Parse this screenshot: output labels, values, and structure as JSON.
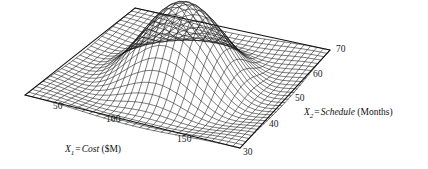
{
  "figure": {
    "background_color": "#ffffff",
    "mesh_color": "#111111",
    "text_color": "#1a1a1a"
  },
  "axes": {
    "x1": {
      "symbol": "X",
      "subscript": "1",
      "equals": "=",
      "variable": "Cost",
      "units": "($M)",
      "full_label": "X1 = Cost ($M)",
      "ticks": [
        "50",
        "100",
        "150"
      ]
    },
    "x2": {
      "symbol": "X",
      "subscript": "2",
      "equals": "=",
      "variable": "Schedule",
      "units": "(Months)",
      "full_label": "X2 = Schedule (Months)",
      "ticks": [
        "30",
        "40",
        "50",
        "60",
        "70"
      ]
    }
  },
  "chart_data": {
    "type": "surface",
    "title": "",
    "subtitle": "",
    "xlabel": "X1 = Cost ($M)",
    "ylabel": "X2 = Schedule (Months)",
    "zlabel": "",
    "projection": "3d-wireframe-mesh",
    "grid": true,
    "legend": null,
    "x": {
      "name": "Cost",
      "units": "$M",
      "tick_values": [
        50,
        100,
        150
      ],
      "range": [
        25,
        175
      ]
    },
    "y": {
      "name": "Schedule",
      "units": "Months",
      "tick_values": [
        30,
        40,
        50,
        60,
        70
      ],
      "range": [
        25,
        75
      ]
    },
    "z": {
      "name": "Probability density",
      "units": "",
      "tick_values": [],
      "range": [
        0,
        1
      ]
    },
    "surface": {
      "description": "Bivariate gaussian-like joint probability density surface with a single central peak",
      "form": "bivariate_normal",
      "mean_x": 100,
      "mean_y": 50,
      "sigma_x": 26,
      "sigma_y": 9,
      "correlation": 0.0,
      "peak_value": 1.0,
      "mesh_rows": 30,
      "mesh_cols": 30
    }
  }
}
